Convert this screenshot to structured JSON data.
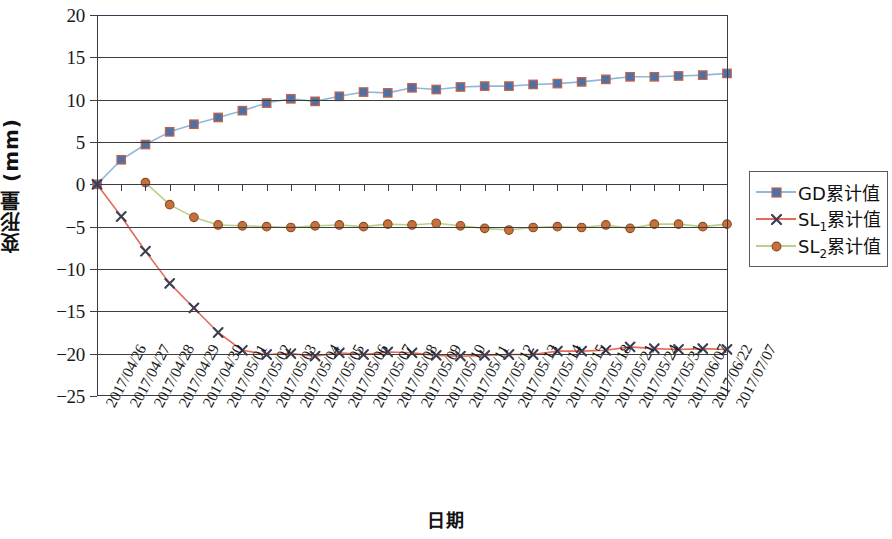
{
  "chart_data": {
    "type": "line",
    "title": "",
    "xlabel": "日期",
    "ylabel": "变形量 (mm)",
    "ylim": [
      -25,
      20
    ],
    "ytick_values": [
      20,
      15,
      10,
      5,
      0,
      -5,
      -10,
      -15,
      -20,
      -25
    ],
    "ytick_labels": [
      "20",
      "15",
      "10",
      "5",
      "0",
      "−5",
      "−10",
      "−15",
      "−20",
      "−25"
    ],
    "grid": true,
    "legend_position": "right",
    "categories": [
      "2017/04/26",
      "2017/04/27",
      "2017/04/28",
      "2017/04/29",
      "2017/04/30",
      "2017/05/01",
      "2017/05/02",
      "2017/05/03",
      "2017/05/04",
      "2017/05/05",
      "2017/05/06",
      "2017/05/07",
      "2017/05/08",
      "2017/05/09",
      "2017/05/10",
      "2017/05/11",
      "2017/05/12",
      "2017/05/13",
      "2017/05/14",
      "2017/05/15",
      "2017/05/18",
      "2017/05/21",
      "2017/05/24",
      "2017/05/31",
      "2017/06/07",
      "2017/06/22",
      "2017/07/07"
    ],
    "series": [
      {
        "name": "GD累计值",
        "marker": "square",
        "line_color": "#8fb8dd",
        "marker_fill": "#4a72a8",
        "marker_edge": "#c0634a",
        "values": [
          0.0,
          2.9,
          4.7,
          6.2,
          7.1,
          7.9,
          8.7,
          9.6,
          10.1,
          9.8,
          10.4,
          10.9,
          10.8,
          11.4,
          11.2,
          11.5,
          11.6,
          11.6,
          11.8,
          11.9,
          12.1,
          12.4,
          12.7,
          12.7,
          12.8,
          12.9,
          13.1
        ]
      },
      {
        "name": "SL1累计值",
        "marker": "x",
        "line_color": "#e26b5a",
        "marker_fill": "#3d3d52",
        "marker_edge": "#3d3d52",
        "values": [
          0.0,
          -3.8,
          -7.9,
          -11.7,
          -14.6,
          -17.5,
          -19.6,
          -20.1,
          -20.0,
          -20.3,
          -19.9,
          -20.1,
          -19.8,
          -19.9,
          -20.2,
          -20.3,
          -20.2,
          -20.1,
          -20.1,
          -19.7,
          -19.7,
          -19.6,
          -19.2,
          -19.4,
          -19.5,
          -19.4,
          -19.5
        ]
      },
      {
        "name": "SL2累计值",
        "marker": "circle",
        "line_color": "#b9d08b",
        "marker_fill": "#c8703a",
        "marker_edge": "#8a4a22",
        "values": [
          null,
          null,
          0.2,
          -2.4,
          -3.9,
          -4.8,
          -4.9,
          -5.0,
          -5.1,
          -4.9,
          -4.8,
          -5.0,
          -4.7,
          -4.8,
          -4.6,
          -4.9,
          -5.2,
          -5.4,
          -5.1,
          -5.0,
          -5.1,
          -4.8,
          -5.2,
          -4.7,
          -4.7,
          -5.0,
          -4.7
        ]
      }
    ]
  },
  "legend": {
    "items": [
      {
        "prefix": "GD",
        "sub": "",
        "suffix": "累计值"
      },
      {
        "prefix": "SL",
        "sub": "1",
        "suffix": "累计值"
      },
      {
        "prefix": "SL",
        "sub": "2",
        "suffix": "累计值"
      }
    ]
  }
}
